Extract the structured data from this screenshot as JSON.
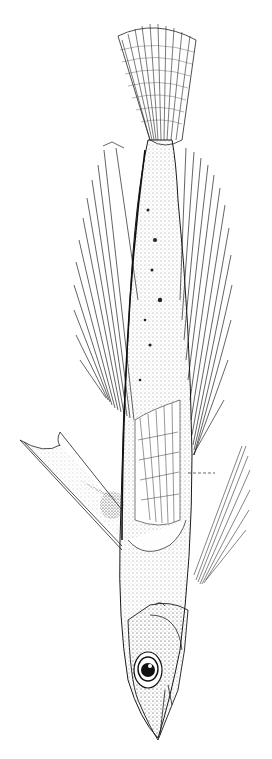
{
  "illustration": {
    "subject": "flying fish",
    "style": "pen-and-ink stipple drawing",
    "orientation": "head down, tail up",
    "background_color": "#ffffff",
    "ink_color": "#1a1a1a",
    "parts": [
      "caudal-fin",
      "caudal-peduncle",
      "pectoral-fin",
      "pelvic-fin",
      "dorsal-fin",
      "anal-fin",
      "body",
      "head",
      "eye",
      "snout"
    ],
    "annotation": "dashed leader line"
  }
}
